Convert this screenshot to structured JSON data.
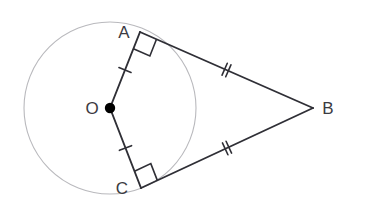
{
  "figure": {
    "canvas": {
      "width": 365,
      "height": 216,
      "background": "#ffffff"
    },
    "colors": {
      "circle_stroke": "#b9b9bd",
      "line_stroke": "#2f2f36",
      "tick_stroke": "#2f2f36",
      "center_dot_fill": "#000000",
      "label_fill": "#3b3b42",
      "right_angle_stroke": "#2f2f36"
    }
  },
  "circle": {
    "name": "circle-O",
    "center_x": 110,
    "center_y": 108,
    "radius": 86,
    "stroke_width": 1.1
  },
  "points": {
    "O": {
      "label": "O",
      "x": 110,
      "y": 108,
      "label_x": 92,
      "label_y": 110,
      "marker": "filled-dot",
      "dot_radius": 5.2
    },
    "A": {
      "label": "A",
      "x": 140,
      "y": 32,
      "label_x": 124,
      "label_y": 34
    },
    "B": {
      "label": "B",
      "x": 313,
      "y": 108,
      "label_x": 328,
      "label_y": 110
    },
    "C": {
      "label": "C",
      "x": 141,
      "y": 188,
      "label_x": 122,
      "label_y": 190
    }
  },
  "segments": [
    {
      "name": "radius-OA",
      "from": "O",
      "to": "A",
      "x1": 110,
      "y1": 108,
      "x2": 140,
      "y2": 32,
      "ticks": 1,
      "stroke_width": 1.9
    },
    {
      "name": "radius-OC",
      "from": "O",
      "to": "C",
      "x1": 110,
      "y1": 108,
      "x2": 141,
      "y2": 188,
      "ticks": 1,
      "stroke_width": 1.9
    },
    {
      "name": "tangent-AB",
      "from": "A",
      "to": "B",
      "x1": 140,
      "y1": 32,
      "x2": 313,
      "y2": 108,
      "ticks": 2,
      "stroke_width": 1.9
    },
    {
      "name": "tangent-CB",
      "from": "C",
      "to": "B",
      "x1": 141,
      "y1": 188,
      "x2": 313,
      "y2": 108,
      "ticks": 2,
      "stroke_width": 1.9
    }
  ],
  "tick_marks": {
    "single_tick_length": 13,
    "double_tick_length": 13,
    "double_tick_gap": 4,
    "stroke_width": 1.6
  },
  "right_angles": [
    {
      "name": "right-angle-at-A",
      "vertex": "A",
      "size": 18,
      "marker": "square",
      "measure_degrees": 90
    },
    {
      "name": "right-angle-at-C",
      "vertex": "C",
      "size": 18,
      "marker": "square",
      "measure_degrees": 90
    }
  ],
  "labels": {
    "A": "A",
    "B": "B",
    "C": "C",
    "O": "O"
  }
}
